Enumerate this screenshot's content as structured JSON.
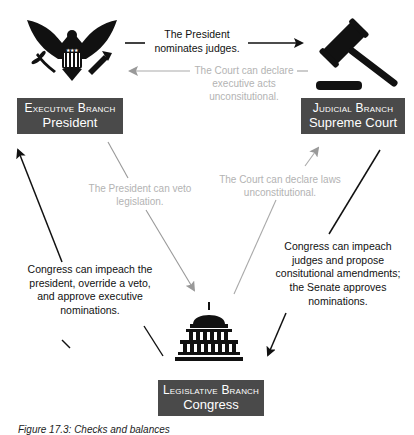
{
  "figure": {
    "caption": "Figure 17.3: Checks and balances"
  },
  "branches": {
    "executive": {
      "branch": "Executive Branch",
      "name": "President",
      "icon": "eagle-seal-icon"
    },
    "judicial": {
      "branch": "Judicial Branch",
      "name": "Supreme Court",
      "icon": "gavel-icon"
    },
    "legislative": {
      "branch": "Legislative Branch",
      "name": "Congress",
      "icon": "capitol-icon"
    }
  },
  "relations": {
    "president_nominates": {
      "text": "The President nominates judges.",
      "line1": "The President",
      "line2": "nominates judges.",
      "style": "dark"
    },
    "court_exec_acts": {
      "line1": "The Court can declare",
      "line2": "executive acts",
      "line3": "unconsitutional.",
      "style": "light"
    },
    "president_veto": {
      "line1": "The President can veto",
      "line2": "legislation.",
      "style": "light"
    },
    "court_laws": {
      "line1": "The Court can declare laws",
      "line2": "unconstitutional.",
      "style": "light"
    },
    "congress_president": {
      "line1": "Congress can impeach the",
      "line2": "president, override a veto,",
      "line3": "and approve executive",
      "line4": "nominations.",
      "style": "dark"
    },
    "congress_judges": {
      "line1": "Congress can impeach",
      "line2": "judges and propose",
      "line3": "consitutional amendments;",
      "line4": "the Senate approves",
      "line5": "nominations.",
      "style": "dark"
    }
  },
  "colors": {
    "label_bg": "#4a4a4a",
    "dark_arrow": "#111111",
    "light_arrow": "#aaaaaa"
  }
}
